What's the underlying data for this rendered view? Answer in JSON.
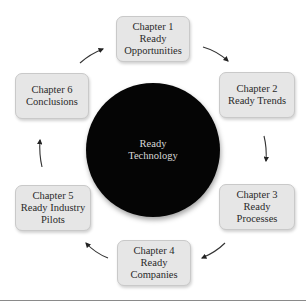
{
  "diagram": {
    "center": {
      "lines": [
        "Ready",
        "Technology"
      ]
    },
    "chapters": [
      {
        "lines": [
          "Chapter 1",
          "Ready",
          "Opportunities"
        ]
      },
      {
        "lines": [
          "Chapter 2",
          "Ready Trends"
        ]
      },
      {
        "lines": [
          "Chapter 3",
          "Ready",
          "Processes"
        ]
      },
      {
        "lines": [
          "Chapter 4",
          "Ready",
          "Companies"
        ]
      },
      {
        "lines": [
          "Chapter 5",
          "Ready Industry",
          "Pilots"
        ]
      },
      {
        "lines": [
          "Chapter 6",
          "Conclusions"
        ]
      }
    ],
    "flow": [
      {
        "from": "Chapter 1",
        "to": "Chapter 2"
      },
      {
        "from": "Chapter 2",
        "to": "Chapter 3"
      },
      {
        "from": "Chapter 3",
        "to": "Chapter 4"
      },
      {
        "from": "Chapter 4",
        "to": "Chapter 5"
      },
      {
        "from": "Chapter 5",
        "to": "Chapter 6"
      },
      {
        "from": "Chapter 6",
        "to": "Chapter 1"
      }
    ]
  }
}
